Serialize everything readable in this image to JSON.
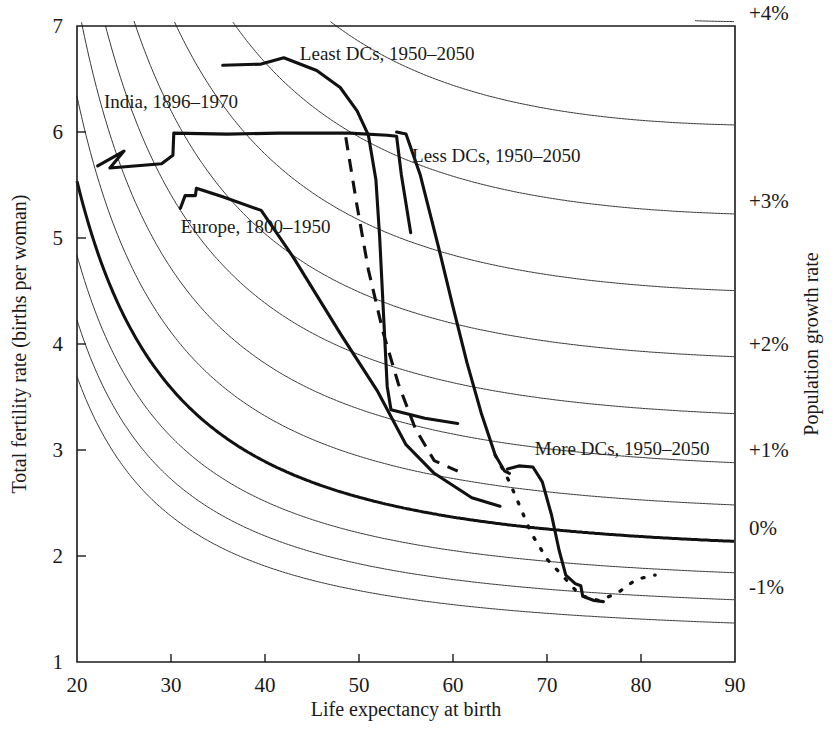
{
  "chart_data": {
    "type": "line",
    "title": "",
    "xlabel": "Life expectancy at birth",
    "ylabel": "Total fertility rate (births per woman)",
    "y2label": "Population growth rate",
    "xlim": [
      20,
      90
    ],
    "ylim": [
      1,
      7
    ],
    "grid": false,
    "legend_position": "inline-annotations",
    "xticks": [
      "20",
      "30",
      "40",
      "50",
      "60",
      "70",
      "80",
      "90"
    ],
    "yticks": [
      "1",
      "2",
      "3",
      "4",
      "5",
      "6",
      "7"
    ],
    "y2ticks": [
      "+4%",
      "+3%",
      "+2%",
      "+1%",
      "0%",
      "-1%"
    ],
    "contours": {
      "description": "Isopleths of population growth rate versus life expectancy and total fertility rate",
      "levels": [
        5.0,
        4.5,
        4.0,
        3.5,
        3.0,
        2.5,
        2.0,
        1.5,
        1.0,
        0.5,
        0.0,
        -0.5,
        -1.0,
        -1.5
      ],
      "labeled_levels": [
        "+4%",
        "+3%",
        "+2%",
        "+1%",
        "0%",
        "-1%"
      ],
      "bold_level": "0%"
    },
    "series": [
      {
        "name": "India, 1896–1970",
        "style": "solid-bold",
        "label": "India, 1896–1970",
        "points": [
          [
            22.2,
            5.68
          ],
          [
            25.0,
            5.82
          ],
          [
            23.5,
            5.66
          ],
          [
            29.0,
            5.7
          ],
          [
            30.2,
            5.78
          ],
          [
            30.3,
            5.99
          ],
          [
            36.0,
            5.98
          ],
          [
            41.5,
            5.99
          ],
          [
            49.0,
            5.99
          ],
          [
            53.0,
            5.97
          ],
          [
            54.0,
            5.96
          ],
          [
            54.5,
            5.6
          ],
          [
            55.5,
            5.05
          ]
        ]
      },
      {
        "name": "Europe, 1800–1950",
        "style": "solid-bold",
        "label": "Europe, 1800–1950",
        "points": [
          [
            31.0,
            5.28
          ],
          [
            31.5,
            5.4
          ],
          [
            32.6,
            5.4
          ],
          [
            32.7,
            5.47
          ],
          [
            35.5,
            5.39
          ],
          [
            39.6,
            5.26
          ],
          [
            43.0,
            4.82
          ],
          [
            48.0,
            4.1
          ],
          [
            52.0,
            3.55
          ],
          [
            55.0,
            3.05
          ],
          [
            58.0,
            2.78
          ],
          [
            62.0,
            2.55
          ],
          [
            65.0,
            2.47
          ]
        ]
      },
      {
        "name": "Least DCs, 1950–2050",
        "style": "solid-bold",
        "label": "Least DCs, 1950–2050",
        "points": [
          [
            35.5,
            6.63
          ],
          [
            39.5,
            6.64
          ],
          [
            42.0,
            6.7
          ],
          [
            45.5,
            6.58
          ],
          [
            48.0,
            6.42
          ],
          [
            49.8,
            6.2
          ],
          [
            51.0,
            5.97
          ],
          [
            51.8,
            5.55
          ],
          [
            52.2,
            5.0
          ],
          [
            52.6,
            4.3
          ],
          [
            53.0,
            3.6
          ],
          [
            53.4,
            3.38
          ],
          [
            57.0,
            3.3
          ],
          [
            60.5,
            3.25
          ]
        ]
      },
      {
        "name": "Less DCs, 1950–2050",
        "style": "solid-bold",
        "label": "Less DCs, 1950–2050",
        "points": [
          [
            54.0,
            6.0
          ],
          [
            55.0,
            5.98
          ],
          [
            56.5,
            5.6
          ],
          [
            58.5,
            4.9
          ],
          [
            60.0,
            4.35
          ],
          [
            61.5,
            3.82
          ],
          [
            63.0,
            3.35
          ],
          [
            64.5,
            2.95
          ],
          [
            65.5,
            2.8
          ],
          [
            66.0,
            2.78
          ]
        ]
      },
      {
        "name": "Less DCs projection (dashed)",
        "style": "dashed",
        "label": "",
        "points": [
          [
            48.6,
            5.95
          ],
          [
            49.8,
            5.3
          ],
          [
            51.0,
            4.7
          ],
          [
            52.6,
            4.1
          ],
          [
            54.2,
            3.62
          ],
          [
            56.0,
            3.2
          ],
          [
            58.0,
            2.9
          ],
          [
            60.5,
            2.8
          ]
        ]
      },
      {
        "name": "More DCs, 1950–2050",
        "style": "solid-bold",
        "label": "More DCs, 1950–2050",
        "points": [
          [
            65.8,
            2.82
          ],
          [
            67.0,
            2.85
          ],
          [
            68.5,
            2.84
          ],
          [
            69.5,
            2.7
          ],
          [
            70.5,
            2.38
          ],
          [
            71.3,
            2.05
          ],
          [
            72.0,
            1.82
          ],
          [
            73.0,
            1.74
          ],
          [
            73.6,
            1.72
          ],
          [
            73.8,
            1.62
          ],
          [
            75.0,
            1.58
          ],
          [
            76.0,
            1.57
          ]
        ]
      },
      {
        "name": "More DCs projection (dotted)",
        "style": "dotted",
        "label": "",
        "points": [
          [
            64.5,
            2.95
          ],
          [
            66.0,
            2.7
          ],
          [
            67.2,
            2.45
          ],
          [
            68.3,
            2.22
          ],
          [
            70.0,
            1.97
          ],
          [
            71.8,
            1.8
          ],
          [
            73.5,
            1.63
          ],
          [
            75.5,
            1.58
          ],
          [
            77.5,
            1.65
          ],
          [
            79.5,
            1.78
          ],
          [
            81.5,
            1.82
          ]
        ]
      }
    ],
    "annotations": [
      {
        "text": "Least DCs, 1950–2050",
        "x": 53.0,
        "y": 6.68
      },
      {
        "text": "India, 1896–1970",
        "x": 30.0,
        "y": 6.23
      },
      {
        "text": "Less DCs, 1950–2050",
        "x": 64.6,
        "y": 5.72
      },
      {
        "text": "Europe, 1800–1950",
        "x": 39.0,
        "y": 5.05
      },
      {
        "text": "More DCs, 1950–2050",
        "x": 78.0,
        "y": 2.95
      }
    ]
  }
}
